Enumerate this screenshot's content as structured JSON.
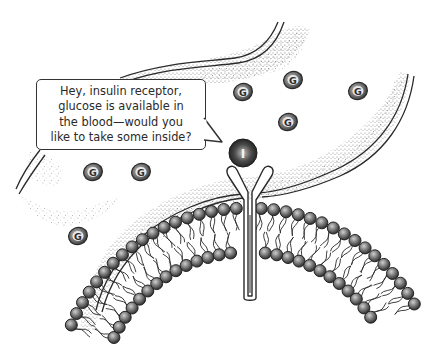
{
  "figure": {
    "speech_bubble": {
      "speaker": "insulin",
      "text": "Hey, insulin receptor,\nglucose is available in\nthe blood—would you\nlike to take some inside?"
    },
    "molecules": {
      "insulin": {
        "label": "I",
        "cx": 243,
        "cy": 153,
        "r": 14
      },
      "glucose": [
        {
          "label": "G",
          "cx": 243,
          "cy": 92
        },
        {
          "label": "G",
          "cx": 293,
          "cy": 80
        },
        {
          "label": "G",
          "cx": 358,
          "cy": 91
        },
        {
          "label": "G",
          "cx": 288,
          "cy": 122
        },
        {
          "label": "G",
          "cx": 93,
          "cy": 172
        },
        {
          "label": "G",
          "cx": 141,
          "cy": 172
        },
        {
          "label": "G",
          "cx": 78,
          "cy": 236
        }
      ]
    },
    "structures": {
      "receptor": "insulin-receptor",
      "membrane": "lipid-bilayer",
      "vessel": "blood-vessel-wall"
    },
    "colors": {
      "ink": "#2a2a2a",
      "stipple": "#8a8a8a",
      "molecule_fill": "#6e6e6e",
      "molecule_dark": "#3a3a3a",
      "background": "#ffffff"
    }
  }
}
